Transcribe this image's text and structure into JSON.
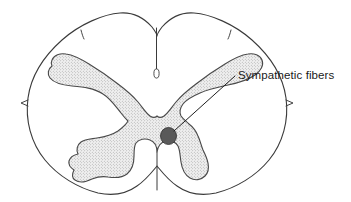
{
  "figure": {
    "background_color": "#ffffff",
    "outline_color": "#3a3a3a",
    "gray_matter_fill_color": "#e8e8e8",
    "gray_matter_stroke_color": "#4a4a4a",
    "marker_color": "#5a5a5a",
    "leader_line_color": "#1f1f1f",
    "text_color": "#1a1a1a"
  },
  "labels": {
    "sympathetic_fibers": "Sympathetic fibers"
  },
  "structures": {
    "white_matter": "white-matter-outline",
    "gray_matter": "gray-matter-butterfly",
    "dorsal_median_sulcus": "dorsal-median-sulcus",
    "ventral_median_fissure": "ventral-median-fissure",
    "marker": "sympathetic-fibers-marker"
  },
  "annotations": [
    {
      "text": "Sympathetic fibers",
      "marker_point": [
        168,
        136
      ],
      "label_point": [
        236,
        76
      ]
    }
  ]
}
